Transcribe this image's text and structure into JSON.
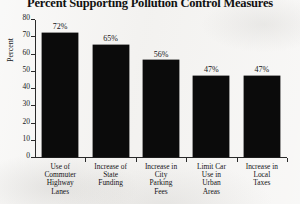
{
  "chart_data": {
    "type": "bar",
    "title": "Percent Supporting Pollution Control Measures",
    "xlabel": "",
    "ylabel": "Percent",
    "ylim": [
      0,
      80
    ],
    "yticks": [
      0,
      10,
      20,
      30,
      40,
      50,
      60,
      70,
      80
    ],
    "grid": false,
    "legend": null,
    "categories": [
      "Use of Commuter Highway Lanes",
      "Increase of State Funding",
      "Increase in City Parking Fees",
      "Limit Car Use in Urban Areas",
      "Increase in Local Taxes"
    ],
    "category_lines": [
      [
        "Use of",
        "Commuter",
        "Highway",
        "Lanes"
      ],
      [
        "Increase of",
        "State",
        "Funding"
      ],
      [
        "Increase in",
        "City",
        "Parking",
        "Fees"
      ],
      [
        "Limit Car",
        "Use in",
        "Urban",
        "Areas"
      ],
      [
        "Increase in",
        "Local",
        "Taxes"
      ]
    ],
    "values": [
      72,
      65,
      56,
      47,
      47
    ],
    "value_labels": [
      "72%",
      "65%",
      "56%",
      "47%",
      "47%"
    ],
    "colors": {
      "bar": "#0b0b0b",
      "axis": "#2a2a2a",
      "text": "#141416",
      "background": "#f3f2f0"
    }
  }
}
